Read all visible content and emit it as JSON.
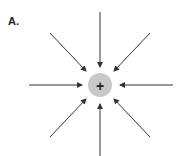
{
  "figure": {
    "panel_label": "A.",
    "cut_off_text": "",
    "charge": {
      "sign": "+",
      "fill_color": "#c8c8c8",
      "sign_color": "#222222",
      "center": [
        100,
        85
      ],
      "radius": 12
    },
    "arrow_color": "#333333",
    "arrow_direction": "inward",
    "arrows": [
      {
        "name": "arrow-top",
        "from": [
          100,
          12
        ],
        "to": [
          100,
          67
        ]
      },
      {
        "name": "arrow-top-right",
        "from": [
          150,
          33
        ],
        "to": [
          114,
          71
        ]
      },
      {
        "name": "arrow-right",
        "from": [
          173,
          85
        ],
        "to": [
          120,
          85
        ]
      },
      {
        "name": "arrow-bottom-right",
        "from": [
          150,
          137
        ],
        "to": [
          114,
          99
        ]
      },
      {
        "name": "arrow-bottom",
        "from": [
          100,
          156
        ],
        "to": [
          100,
          104
        ]
      },
      {
        "name": "arrow-bottom-left",
        "from": [
          50,
          137
        ],
        "to": [
          86,
          99
        ]
      },
      {
        "name": "arrow-left",
        "from": [
          29,
          85
        ],
        "to": [
          82,
          85
        ]
      },
      {
        "name": "arrow-top-left",
        "from": [
          50,
          33
        ],
        "to": [
          86,
          71
        ]
      }
    ]
  }
}
